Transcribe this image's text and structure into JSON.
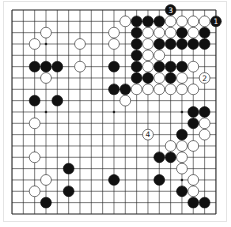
{
  "diagram": {
    "type": "go-board",
    "size": 19,
    "colors": {
      "background": "#ffffff",
      "line": "#222222",
      "black": "#111111",
      "white": "#ffffff",
      "stone_outline": "#222222",
      "frame": "#e4e4e4"
    },
    "hoshi": [
      [
        3,
        3
      ],
      [
        9,
        3
      ],
      [
        15,
        3
      ],
      [
        3,
        9
      ],
      [
        9,
        9
      ],
      [
        15,
        9
      ],
      [
        3,
        15
      ],
      [
        9,
        15
      ],
      [
        15,
        15
      ]
    ],
    "numbered_moves": [
      {
        "n": "1",
        "color": "black",
        "col": 18,
        "row": 1
      },
      {
        "n": "2",
        "color": "white",
        "col": 17,
        "row": 6
      },
      {
        "n": "3",
        "color": "black",
        "col": 14,
        "row": 0
      },
      {
        "n": "4",
        "color": "white",
        "col": 12,
        "row": 11
      }
    ],
    "black_stones": [
      [
        11,
        1
      ],
      [
        12,
        1
      ],
      [
        13,
        1
      ],
      [
        11,
        2
      ],
      [
        15,
        2
      ],
      [
        17,
        2
      ],
      [
        11,
        3
      ],
      [
        13,
        3
      ],
      [
        14,
        3
      ],
      [
        15,
        3
      ],
      [
        16,
        3
      ],
      [
        17,
        3
      ],
      [
        11,
        4
      ],
      [
        2,
        5
      ],
      [
        3,
        5
      ],
      [
        4,
        5
      ],
      [
        9,
        5
      ],
      [
        11,
        5
      ],
      [
        13,
        5
      ],
      [
        14,
        5
      ],
      [
        15,
        5
      ],
      [
        11,
        6
      ],
      [
        12,
        6
      ],
      [
        14,
        6
      ],
      [
        9,
        7
      ],
      [
        10,
        7
      ],
      [
        2,
        8
      ],
      [
        4,
        8
      ],
      [
        16,
        9
      ],
      [
        17,
        9
      ],
      [
        16,
        10
      ],
      [
        15,
        11
      ],
      [
        13,
        13
      ],
      [
        14,
        13
      ],
      [
        5,
        14
      ],
      [
        9,
        15
      ],
      [
        13,
        15
      ],
      [
        5,
        16
      ],
      [
        15,
        16
      ],
      [
        3,
        17
      ],
      [
        16,
        17
      ],
      [
        17,
        17
      ]
    ],
    "white_stones": [
      [
        10,
        1
      ],
      [
        14,
        1
      ],
      [
        15,
        1
      ],
      [
        16,
        1
      ],
      [
        17,
        1
      ],
      [
        3,
        2
      ],
      [
        9,
        2
      ],
      [
        12,
        2
      ],
      [
        13,
        2
      ],
      [
        14,
        2
      ],
      [
        16,
        2
      ],
      [
        2,
        3
      ],
      [
        6,
        3
      ],
      [
        9,
        3
      ],
      [
        12,
        3
      ],
      [
        12,
        4
      ],
      [
        13,
        4
      ],
      [
        6,
        5
      ],
      [
        12,
        5
      ],
      [
        16,
        5
      ],
      [
        3,
        6
      ],
      [
        13,
        6
      ],
      [
        15,
        6
      ],
      [
        11,
        7
      ],
      [
        12,
        7
      ],
      [
        13,
        7
      ],
      [
        14,
        7
      ],
      [
        15,
        7
      ],
      [
        16,
        7
      ],
      [
        10,
        8
      ],
      [
        2,
        10
      ],
      [
        17,
        10
      ],
      [
        17,
        11
      ],
      [
        14,
        12
      ],
      [
        15,
        12
      ],
      [
        16,
        12
      ],
      [
        2,
        13
      ],
      [
        15,
        13
      ],
      [
        15,
        14
      ],
      [
        3,
        15
      ],
      [
        16,
        15
      ],
      [
        2,
        16
      ],
      [
        16,
        16
      ]
    ]
  }
}
